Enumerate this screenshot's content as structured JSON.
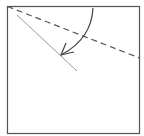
{
  "diagram": {
    "type": "origami-fold-step",
    "colors": {
      "paper_edge": "#555555",
      "fold_line": "#555555",
      "crease_line": "#9a9a9a",
      "arrow": "#444444",
      "background": "#ffffff"
    },
    "elements": {
      "paper": {
        "shape": "square",
        "x": 7,
        "y": 6,
        "width": 133,
        "height": 128
      },
      "valley_fold_line": {
        "style": "dashed",
        "from": [
          7,
          6
        ],
        "to": [
          140,
          58
        ]
      },
      "existing_crease": {
        "style": "solid",
        "from": [
          17,
          15
        ],
        "to": [
          77,
          71
        ]
      },
      "fold_arrow": {
        "style": "curved",
        "from": [
          93,
          8
        ],
        "to": [
          61,
          55
        ],
        "direction": "down-left"
      }
    }
  }
}
